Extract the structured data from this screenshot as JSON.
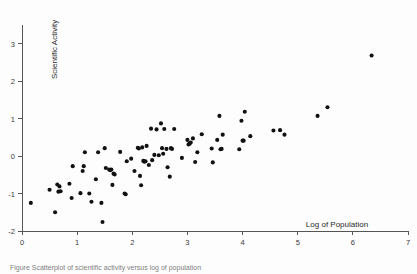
{
  "figure": {
    "title": "",
    "caption_partial": "Figure  Scatterplot of scientific activity versus log of population"
  },
  "axes": {
    "x_title": "Log of Population",
    "y_title": "Scientific Activity",
    "x_ticks": [
      "0",
      "1",
      "2",
      "3",
      "4",
      "5",
      "6",
      "7"
    ],
    "y_ticks": [
      "3",
      "2",
      "1",
      "0",
      "-1",
      "-2"
    ],
    "x_tick_values": [
      0,
      1,
      2,
      3,
      4,
      5,
      6,
      7
    ],
    "y_tick_values": [
      3,
      2,
      1,
      0,
      -1,
      -2
    ],
    "x_range": [
      0,
      7
    ],
    "y_range": [
      -2,
      3.5
    ],
    "grid": false
  },
  "colors": {
    "marker": "#111111",
    "axis": "#555555",
    "text": "#2a2a2a",
    "background": "#fdfdfd"
  },
  "chart_data": {
    "type": "scatter",
    "title": "",
    "xlabel": "Log of Population",
    "ylabel": "Scientific Activity",
    "xlim": [
      0,
      7
    ],
    "ylim": [
      -2,
      3.5
    ],
    "grid": false,
    "legend": null,
    "series": [
      {
        "name": "countries",
        "marker": "filled-circle",
        "points": [
          [
            0.16,
            -1.25
          ],
          [
            0.5,
            -0.9
          ],
          [
            0.6,
            -1.5
          ],
          [
            0.64,
            -0.76
          ],
          [
            0.68,
            -0.81
          ],
          [
            0.66,
            -0.95
          ],
          [
            0.7,
            -0.94
          ],
          [
            0.86,
            -0.74
          ],
          [
            0.9,
            -1.12
          ],
          [
            0.92,
            -0.27
          ],
          [
            1.06,
            -0.99
          ],
          [
            1.1,
            -0.4
          ],
          [
            1.12,
            -0.27
          ],
          [
            1.14,
            0.1
          ],
          [
            1.22,
            -1.0
          ],
          [
            1.26,
            -1.22
          ],
          [
            1.34,
            -0.62
          ],
          [
            1.38,
            0.1
          ],
          [
            1.44,
            -1.25
          ],
          [
            1.46,
            -1.76
          ],
          [
            1.5,
            0.21
          ],
          [
            1.52,
            -0.32
          ],
          [
            1.58,
            -0.36
          ],
          [
            1.6,
            -0.38
          ],
          [
            1.62,
            -0.36
          ],
          [
            1.64,
            -0.77
          ],
          [
            1.66,
            -0.47
          ],
          [
            1.68,
            -0.49
          ],
          [
            1.78,
            0.11
          ],
          [
            1.86,
            -1.0
          ],
          [
            1.88,
            -1.02
          ],
          [
            1.9,
            -0.14
          ],
          [
            1.98,
            -0.07
          ],
          [
            2.04,
            -0.4
          ],
          [
            2.1,
            0.22
          ],
          [
            2.12,
            0.2
          ],
          [
            2.14,
            -0.53
          ],
          [
            2.16,
            -0.78
          ],
          [
            2.18,
            0.23
          ],
          [
            2.2,
            -0.13
          ],
          [
            2.22,
            -0.15
          ],
          [
            2.24,
            -0.14
          ],
          [
            2.26,
            0.27
          ],
          [
            2.3,
            -0.24
          ],
          [
            2.34,
            0.73
          ],
          [
            2.36,
            -0.11
          ],
          [
            2.4,
            0.03
          ],
          [
            2.44,
            0.71
          ],
          [
            2.48,
            0.02
          ],
          [
            2.52,
            0.87
          ],
          [
            2.54,
            0.21
          ],
          [
            2.56,
            0.06
          ],
          [
            2.58,
            0.72
          ],
          [
            2.62,
            0.19
          ],
          [
            2.64,
            -0.3
          ],
          [
            2.68,
            -0.55
          ],
          [
            2.7,
            0.21
          ],
          [
            2.72,
            0.19
          ],
          [
            2.76,
            0.72
          ],
          [
            2.9,
            -0.05
          ],
          [
            3.0,
            0.43
          ],
          [
            3.02,
            0.31
          ],
          [
            3.04,
            0.33
          ],
          [
            3.06,
            0.36
          ],
          [
            3.1,
            0.47
          ],
          [
            3.14,
            -0.16
          ],
          [
            3.18,
            0.1
          ],
          [
            3.26,
            0.58
          ],
          [
            3.44,
            0.2
          ],
          [
            3.46,
            -0.17
          ],
          [
            3.54,
            0.43
          ],
          [
            3.58,
            1.07
          ],
          [
            3.6,
            0.18
          ],
          [
            3.62,
            0.19
          ],
          [
            3.64,
            0.57
          ],
          [
            3.94,
            0.18
          ],
          [
            3.98,
            0.94
          ],
          [
            4.0,
            0.41
          ],
          [
            4.02,
            0.41
          ],
          [
            4.04,
            1.18
          ],
          [
            4.14,
            0.53
          ],
          [
            4.56,
            0.68
          ],
          [
            4.68,
            0.69
          ],
          [
            4.76,
            0.57
          ],
          [
            5.36,
            1.07
          ],
          [
            5.54,
            1.3
          ],
          [
            6.34,
            2.68
          ]
        ]
      }
    ],
    "n_points": 87
  }
}
